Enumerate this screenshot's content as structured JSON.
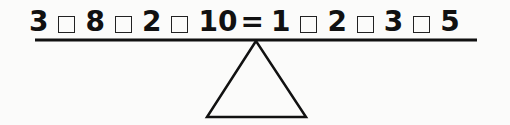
{
  "puzzle": {
    "left_side": {
      "numbers": [
        "3",
        "8",
        "2",
        "10"
      ],
      "operator_blanks": 3
    },
    "equals": "=",
    "right_side": {
      "numbers": [
        "1",
        "2",
        "3",
        "5"
      ],
      "operator_blanks": 3
    },
    "beam": {
      "x1": 35,
      "x2": 477,
      "y": 40,
      "color": "#111111"
    },
    "fulcrum": {
      "shape": "triangle",
      "apex": [
        256,
        41
      ],
      "base_left": [
        207,
        117
      ],
      "base_right": [
        306,
        117
      ],
      "color": "#111111"
    }
  }
}
